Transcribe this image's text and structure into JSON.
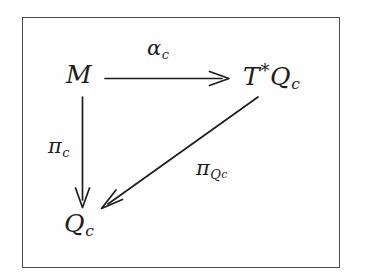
{
  "figure": {
    "kind": "commutative-diagram",
    "border_color": "#4a4a4a",
    "ink_color": "#1d1d1d",
    "background_color": "#ffffff"
  },
  "nodes": [
    {
      "id": "M",
      "label": "M",
      "base": "M",
      "sup": "",
      "sub": "",
      "x": 82,
      "y": 76
    },
    {
      "id": "TQc",
      "label": "T*Q_c",
      "base": "T",
      "sup": "*",
      "mid": "Q",
      "sub": "c",
      "x": 272,
      "y": 76
    },
    {
      "id": "Qc",
      "label": "Q_c",
      "base": "Q",
      "sup": "",
      "sub": "c",
      "x": 82,
      "y": 225
    }
  ],
  "edges": [
    {
      "id": "alpha-c",
      "from": "M",
      "to": "TQc",
      "label_base": "α",
      "label_sub": "c",
      "style": "straight-horizontal",
      "arrowhead": "open"
    },
    {
      "id": "pi-c",
      "from": "M",
      "to": "Qc",
      "label_base": "π",
      "label_sub": "c",
      "style": "straight-vertical",
      "arrowhead": "open"
    },
    {
      "id": "pi-Qc",
      "from": "TQc",
      "to": "Qc",
      "label_base": "π",
      "label_sub": "Q",
      "label_subsub": "c",
      "style": "straight-diagonal",
      "arrowhead": "open"
    }
  ]
}
